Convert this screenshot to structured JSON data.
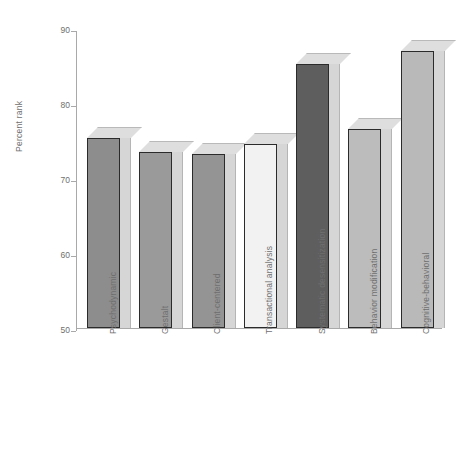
{
  "chart_data": {
    "type": "bar",
    "title": "",
    "subtitle": "",
    "xlabel": "",
    "ylabel": "Percent rank",
    "ylim": [
      50,
      90
    ],
    "yticks": [
      50,
      60,
      70,
      80,
      90
    ],
    "ytick_labels": [
      "50",
      "60",
      "70",
      "80",
      "90"
    ],
    "grid": false,
    "legend": null,
    "style": "3d-bars-grayscale",
    "categories": [
      "Psychodynamic",
      "Gestalt",
      "Client-centered",
      "Transactional analysis",
      "Systematic desensitization",
      "Behavior modification",
      "Cognitive-behavioral"
    ],
    "values": [
      75.3,
      73.5,
      73.2,
      74.6,
      85.2,
      76.6,
      87.0
    ],
    "bar_colors": [
      "#8d8d8d",
      "#9a9a9a",
      "#949494",
      "#f2f2f2",
      "#5e5e5e",
      "#bcbcbc",
      "#b9b9b9"
    ],
    "bar_edge_color": "#2b2b2b",
    "axis_color": "#a9a9a9",
    "text_color": "#6f6f6f",
    "background": "#ffffff"
  },
  "axis": {
    "y_label": "Percent rank",
    "ticks": [
      {
        "label": "90",
        "value": 90
      },
      {
        "label": "80",
        "value": 80
      },
      {
        "label": "70",
        "value": 70
      },
      {
        "label": "60",
        "value": 60
      },
      {
        "label": "50",
        "value": 50
      }
    ]
  },
  "bars": [
    {
      "label": "Psychodynamic",
      "value": 75.3,
      "color": "#8d8d8d"
    },
    {
      "label": "Gestalt",
      "value": 73.5,
      "color": "#9a9a9a"
    },
    {
      "label": "Client-centered",
      "value": 73.2,
      "color": "#949494"
    },
    {
      "label": "Transactional analysis",
      "value": 74.6,
      "color": "#f2f2f2"
    },
    {
      "label": "Systematic desensitization",
      "value": 85.2,
      "color": "#5e5e5e"
    },
    {
      "label": "Behavior modification",
      "value": 76.6,
      "color": "#bcbcbc"
    },
    {
      "label": "Cognitive-behavioral",
      "value": 87.0,
      "color": "#b9b9b9"
    }
  ]
}
